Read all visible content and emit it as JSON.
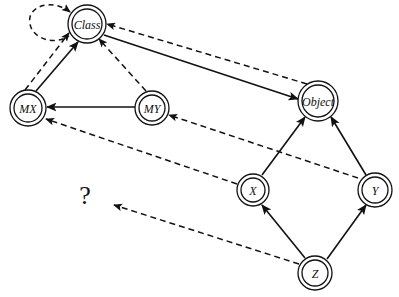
{
  "diagram": {
    "background_color": "#ffffff",
    "stroke_color": "#111111",
    "width": 399,
    "height": 297,
    "nodes": [
      {
        "id": "Class",
        "label": "Class",
        "x": 87,
        "y": 24,
        "r_outer": 19,
        "r_inner": 15
      },
      {
        "id": "MX",
        "label": "MX",
        "x": 28,
        "y": 108,
        "r_outer": 18,
        "r_inner": 14
      },
      {
        "id": "MY",
        "label": "MY",
        "x": 152,
        "y": 108,
        "r_outer": 17,
        "r_inner": 13
      },
      {
        "id": "Object",
        "label": "Object",
        "x": 318,
        "y": 101,
        "r_outer": 20,
        "r_inner": 16
      },
      {
        "id": "X",
        "label": "X",
        "x": 253,
        "y": 190,
        "r_outer": 16,
        "r_inner": 12
      },
      {
        "id": "Y",
        "label": "Y",
        "x": 375,
        "y": 190,
        "r_outer": 17,
        "r_inner": 13
      },
      {
        "id": "Z",
        "label": "Z",
        "x": 315,
        "y": 273,
        "r_outer": 17,
        "r_inner": 13
      }
    ],
    "edges": [
      {
        "id": "class-self-loop",
        "from": "Class",
        "to": "Class",
        "style": "dashed",
        "arrow": "to",
        "kind": "self-loop"
      },
      {
        "id": "mx-to-class-solid",
        "from": "MX",
        "to": "Class",
        "style": "solid",
        "arrow": "to"
      },
      {
        "id": "mx-to-class-dashed",
        "from": "MX",
        "to": "Class",
        "style": "dashed",
        "arrow": "to"
      },
      {
        "id": "my-to-class-dashed",
        "from": "MY",
        "to": "Class",
        "style": "dashed",
        "arrow": "to"
      },
      {
        "id": "class-to-object-solid",
        "from": "Class",
        "to": "Object",
        "style": "solid",
        "arrow": "to"
      },
      {
        "id": "object-to-class-dashed",
        "from": "Object",
        "to": "Class",
        "style": "dashed",
        "arrow": "to"
      },
      {
        "id": "my-to-mx-solid",
        "from": "MY",
        "to": "MX",
        "style": "solid",
        "arrow": "to"
      },
      {
        "id": "x-to-mx-dashed",
        "from": "X",
        "to": "MX",
        "style": "dashed",
        "arrow": "to"
      },
      {
        "id": "y-to-my-dashed",
        "from": "Y",
        "to": "MY",
        "style": "dashed",
        "arrow": "to"
      },
      {
        "id": "x-to-object-solid",
        "from": "X",
        "to": "Object",
        "style": "solid",
        "arrow": "to"
      },
      {
        "id": "y-to-object-solid",
        "from": "Y",
        "to": "Object",
        "style": "solid",
        "arrow": "to"
      },
      {
        "id": "z-to-x-solid",
        "from": "Z",
        "to": "X",
        "style": "solid",
        "arrow": "to"
      },
      {
        "id": "z-to-y-solid",
        "from": "Z",
        "to": "Y",
        "style": "solid",
        "arrow": "to"
      },
      {
        "id": "z-to-unknown-dashed",
        "from": "Z",
        "to": "unknown",
        "style": "dashed",
        "arrow": "to"
      }
    ],
    "annotations": [
      {
        "id": "unknown",
        "label": "?",
        "x": 85,
        "y": 195
      }
    ]
  }
}
